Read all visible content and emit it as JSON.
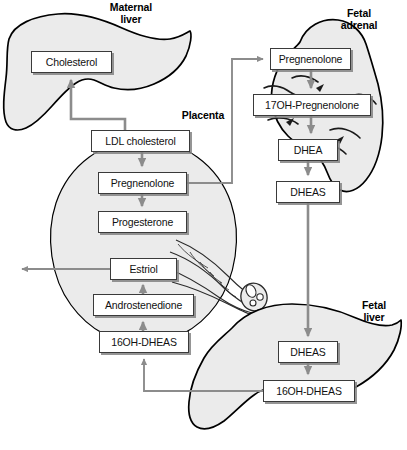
{
  "diagram": {
    "organs": [
      {
        "id": "maternal-liver",
        "label": "Maternal\nliver",
        "x": 104,
        "y": 2,
        "w": 54
      },
      {
        "id": "placenta",
        "label": "Placenta",
        "x": 175,
        "y": 110,
        "w": 56
      },
      {
        "id": "fetal-adrenal",
        "label": "Fetal\nadrenal",
        "x": 330,
        "y": 8,
        "w": 58
      },
      {
        "id": "fetal-liver",
        "label": "Fetal\nliver",
        "x": 353,
        "y": 300,
        "w": 42
      }
    ],
    "nodes": [
      {
        "id": "cholesterol",
        "label": "Cholesterol",
        "x": 31,
        "y": 51,
        "w": 81,
        "h": 22
      },
      {
        "id": "ldl-cholesterol",
        "label": "LDL cholesterol",
        "x": 91,
        "y": 130,
        "w": 99,
        "h": 22
      },
      {
        "id": "pregnenolone-placenta",
        "label": "Pregnenolone",
        "x": 98,
        "y": 172,
        "w": 89,
        "h": 22
      },
      {
        "id": "progesterone",
        "label": "Progesterone",
        "x": 98,
        "y": 211,
        "w": 89,
        "h": 22
      },
      {
        "id": "estriol",
        "label": "Estriol",
        "x": 110,
        "y": 258,
        "w": 67,
        "h": 22
      },
      {
        "id": "androstenedione",
        "label": "Androstenedione",
        "x": 93,
        "y": 294,
        "w": 101,
        "h": 22
      },
      {
        "id": "16oh-dheas-placenta",
        "label": "16OH-DHEAS",
        "x": 99,
        "y": 331,
        "w": 90,
        "h": 22
      },
      {
        "id": "pregnenolone-adrenal",
        "label": "Pregnenolone",
        "x": 270,
        "y": 48,
        "w": 81,
        "h": 22
      },
      {
        "id": "17oh-pregnenolone",
        "label": "17OH-Pregnenolone",
        "x": 253,
        "y": 94,
        "w": 118,
        "h": 22
      },
      {
        "id": "dhea",
        "label": "DHEA",
        "x": 278,
        "y": 139,
        "w": 60,
        "h": 22
      },
      {
        "id": "dheas-adrenal",
        "label": "DHEAS",
        "x": 276,
        "y": 181,
        "w": 64,
        "h": 22
      },
      {
        "id": "dheas-liver",
        "label": "DHEAS",
        "x": 278,
        "y": 341,
        "w": 60,
        "h": 22
      },
      {
        "id": "16oh-dheas-liver",
        "label": "16OH-DHEAS",
        "x": 263,
        "y": 380,
        "w": 92,
        "h": 22
      }
    ],
    "arrows": [
      {
        "id": "ldl-to-cholesterol",
        "from": "ldl-cholesterol",
        "to": "cholesterol"
      },
      {
        "id": "ldl-to-pregnenolone",
        "from": "ldl-cholesterol",
        "to": "pregnenolone-placenta"
      },
      {
        "id": "pregnenolone-to-progesterone",
        "from": "pregnenolone-placenta",
        "to": "progesterone"
      },
      {
        "id": "pregnenolone-to-fetal-adrenal",
        "from": "pregnenolone-placenta",
        "to": "pregnenolone-adrenal"
      },
      {
        "id": "estriol-to-maternal-circulation",
        "from": "estriol",
        "to": "maternal-circulation"
      },
      {
        "id": "androstenedione-to-estriol",
        "from": "androstenedione",
        "to": "estriol"
      },
      {
        "id": "16oh-dheas-to-androstenedione",
        "from": "16oh-dheas-placenta",
        "to": "androstenedione"
      },
      {
        "id": "adrenal-pregnenolone-to-17oh",
        "from": "pregnenolone-adrenal",
        "to": "17oh-pregnenolone"
      },
      {
        "id": "17oh-to-dhea",
        "from": "17oh-pregnenolone",
        "to": "dhea"
      },
      {
        "id": "dhea-to-dheas",
        "from": "dhea",
        "to": "dheas-adrenal"
      },
      {
        "id": "dheas-to-fetal-liver",
        "from": "dheas-adrenal",
        "to": "dheas-liver"
      },
      {
        "id": "liver-dheas-to-16oh",
        "from": "dheas-liver",
        "to": "16oh-dheas-liver"
      },
      {
        "id": "liver-16oh-to-placenta-16oh",
        "from": "16oh-dheas-liver",
        "to": "16oh-dheas-placenta"
      }
    ],
    "colors": {
      "organ_fill": "#ebebeb",
      "organ_stroke": "#000000",
      "arrow": "#8c8c8c",
      "box_stroke": "#3a3a3a",
      "box_fill": "#ffffff",
      "box_shadow": "#9a9a9a",
      "text": "#111111",
      "background": "#ffffff"
    }
  }
}
